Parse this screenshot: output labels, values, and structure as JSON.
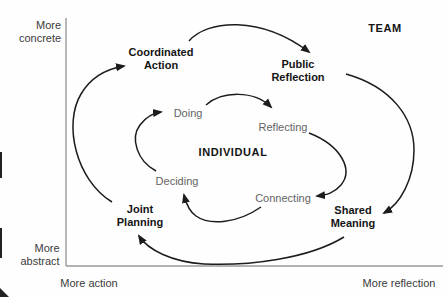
{
  "diagram": {
    "type": "cycle-diagram",
    "team_label": "TEAM",
    "individual_label": "INDIVIDUAL",
    "axis": {
      "y_top": [
        "More",
        "concrete"
      ],
      "y_bottom": [
        "More",
        "abstract"
      ],
      "x_left": "More action",
      "x_right": "More reflection"
    },
    "team_cycle": {
      "nodes": {
        "coordinated_action": {
          "line1": "Coordinated",
          "line2": "Action"
        },
        "public_reflection": {
          "line1": "Public",
          "line2": "Reflection"
        },
        "shared_meaning": {
          "line1": "Shared",
          "line2": "Meaning"
        },
        "joint_planning": {
          "line1": "Joint",
          "line2": "Planning"
        }
      },
      "edges": [
        {
          "from": "joint_planning",
          "to": "coordinated_action"
        },
        {
          "from": "coordinated_action",
          "to": "public_reflection"
        },
        {
          "from": "public_reflection",
          "to": "shared_meaning"
        },
        {
          "from": "shared_meaning",
          "to": "joint_planning"
        }
      ]
    },
    "individual_cycle": {
      "nodes": {
        "doing": "Doing",
        "reflecting": "Reflecting",
        "connecting": "Connecting",
        "deciding": "Deciding"
      },
      "edges": [
        {
          "from": "deciding",
          "to": "doing"
        },
        {
          "from": "doing",
          "to": "reflecting"
        },
        {
          "from": "reflecting",
          "to": "connecting"
        },
        {
          "from": "connecting",
          "to": "deciding"
        }
      ]
    },
    "colors": {
      "arrow": "#1c1c1c",
      "axis_line": "#999999",
      "team_text": "#141414",
      "individual_text": "#636363",
      "axis_text": "#3b3b3b",
      "background": "#fefefe"
    }
  }
}
